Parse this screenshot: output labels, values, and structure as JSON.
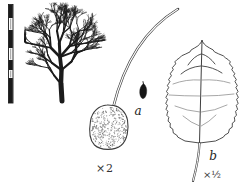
{
  "figure": {
    "caption_a": "a",
    "caption_b": "b",
    "magnification_fruit": "×2",
    "magnification_leaf": "×½"
  },
  "palette": {
    "ink": "#1b1b1b",
    "line": "#3f3f3f",
    "vein_light": "#8a8a8a",
    "stipple": "#7a7a7a",
    "paper": "#ffffff"
  }
}
